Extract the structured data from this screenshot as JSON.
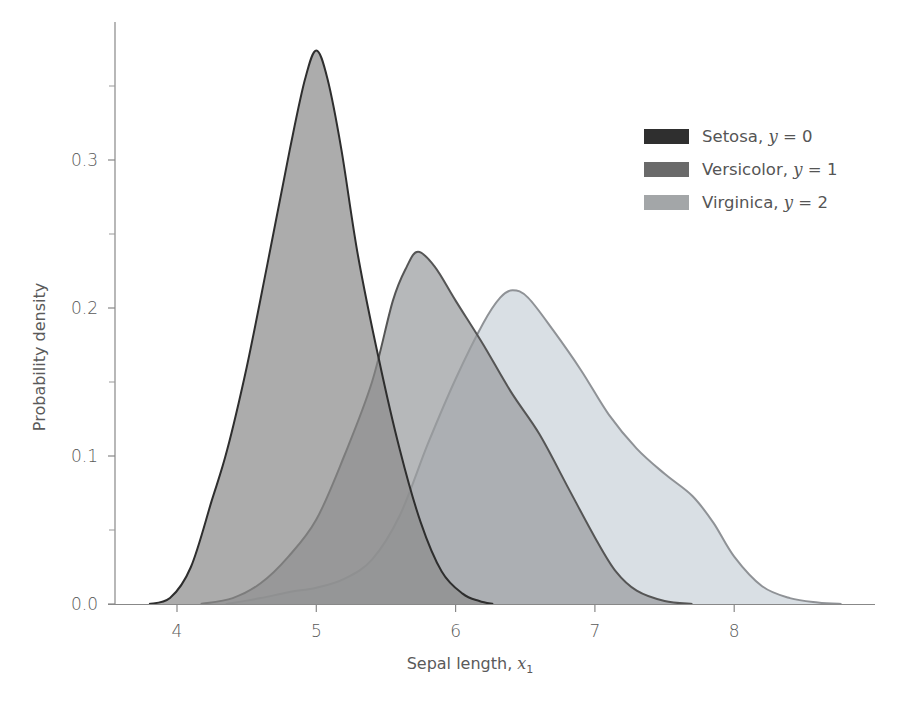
{
  "chart_data": {
    "type": "area",
    "title": "",
    "xlabel": "Sepal length, x1",
    "xlabel_text": "Sepal length, ",
    "xlabel_var": "x",
    "xlabel_sub": "1",
    "ylabel": "Probability density",
    "xlim": [
      3.55,
      8.85
    ],
    "ylim": [
      0.0,
      0.385
    ],
    "xticks": [
      4,
      5,
      6,
      7,
      8
    ],
    "xtick_labels": [
      "4",
      "5",
      "6",
      "7",
      "8"
    ],
    "yticks": [
      0.0,
      0.1,
      0.2,
      0.3
    ],
    "ytick_labels": [
      "0.0",
      "0.1",
      "0.2",
      "0.3"
    ],
    "yminor_ticks": [
      0.05,
      0.15,
      0.25,
      0.35
    ],
    "grid": false,
    "legend_position": "upper right",
    "series": [
      {
        "name": "Setosa, y = 0",
        "label_text": "Setosa, ",
        "label_var": "y",
        "label_eq": " = 0",
        "fill": "#8c8c8c",
        "stroke": "#2e2e2e",
        "swatch": "#2f2f2f",
        "x": [
          3.8,
          3.95,
          4.1,
          4.25,
          4.36,
          4.5,
          4.65,
          4.81,
          4.92,
          5.0,
          5.08,
          5.18,
          5.3,
          5.45,
          5.6,
          5.75,
          5.9,
          6.05,
          6.17,
          6.27
        ],
        "y": [
          0.0,
          0.004,
          0.025,
          0.07,
          0.104,
          0.16,
          0.23,
          0.307,
          0.355,
          0.374,
          0.355,
          0.307,
          0.235,
          0.165,
          0.104,
          0.055,
          0.022,
          0.007,
          0.002,
          0.0
        ]
      },
      {
        "name": "Versicolor, y = 1",
        "label_text": "Versicolor, ",
        "label_var": "y",
        "label_eq": " = 1",
        "fill": "#9a9d9f",
        "stroke": "#555555",
        "swatch": "#6a6a6a",
        "x": [
          4.17,
          4.4,
          4.6,
          4.8,
          5.0,
          5.2,
          5.4,
          5.55,
          5.65,
          5.73,
          5.85,
          6.0,
          6.2,
          6.4,
          6.6,
          6.8,
          7.0,
          7.15,
          7.3,
          7.5,
          7.7
        ],
        "y": [
          0.0,
          0.004,
          0.014,
          0.032,
          0.057,
          0.1,
          0.15,
          0.205,
          0.228,
          0.238,
          0.228,
          0.205,
          0.175,
          0.143,
          0.115,
          0.08,
          0.045,
          0.022,
          0.009,
          0.002,
          0.0
        ]
      },
      {
        "name": "Virginica, y = 2",
        "label_text": "Virginica, ",
        "label_var": "y",
        "label_eq": " = 2",
        "fill": "#d2d9df",
        "stroke": "#8f9296",
        "swatch": "#a3a6a8",
        "x": [
          4.35,
          4.6,
          4.8,
          5.0,
          5.2,
          5.4,
          5.6,
          5.8,
          6.0,
          6.2,
          6.32,
          6.41,
          6.52,
          6.7,
          6.9,
          7.1,
          7.3,
          7.5,
          7.7,
          7.85,
          8.0,
          8.2,
          8.4,
          8.6,
          8.77
        ],
        "y": [
          0.0,
          0.004,
          0.008,
          0.011,
          0.017,
          0.03,
          0.06,
          0.108,
          0.152,
          0.19,
          0.207,
          0.212,
          0.207,
          0.185,
          0.158,
          0.128,
          0.105,
          0.088,
          0.073,
          0.055,
          0.032,
          0.012,
          0.004,
          0.001,
          0.0
        ]
      }
    ]
  }
}
